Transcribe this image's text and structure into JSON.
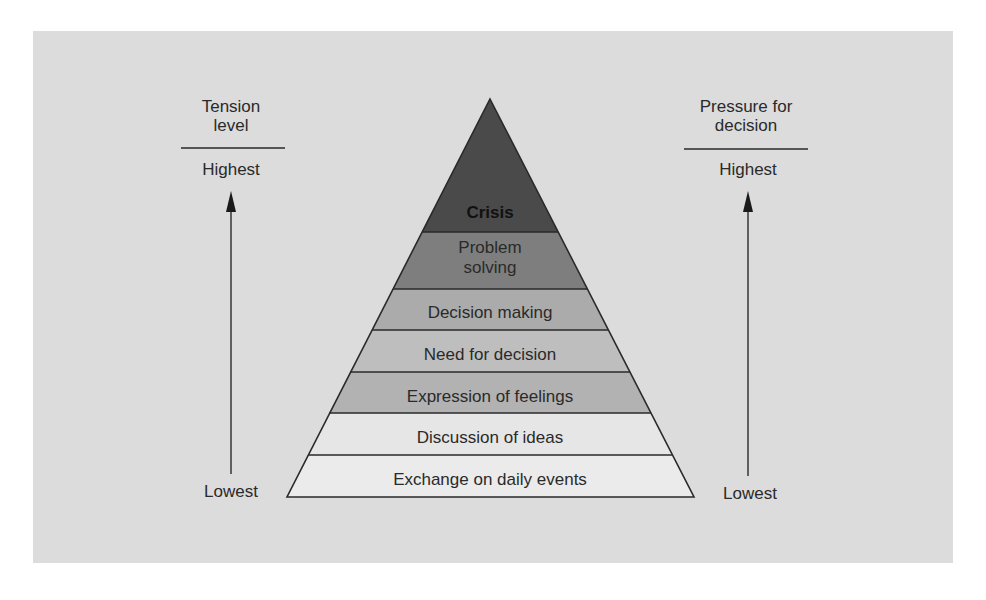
{
  "diagram": {
    "type": "pyramid",
    "levels": [
      {
        "label": "Crisis",
        "fill": "#4a4a4a",
        "bold": true
      },
      {
        "label": "Problem solving",
        "line1": "Problem",
        "line2": "solving",
        "fill": "#7e7e7e"
      },
      {
        "label": "Decision making",
        "fill": "#ababab"
      },
      {
        "label": "Need for decision",
        "fill": "#bebebe"
      },
      {
        "label": "Expression of feelings",
        "fill": "#b2b2b2"
      },
      {
        "label": "Discussion of ideas",
        "fill": "#e6e6e6"
      },
      {
        "label": "Exchange on daily events",
        "fill": "#ebebeb"
      }
    ],
    "order": "top-to-bottom"
  },
  "left_axis": {
    "title_line1": "Tension",
    "title_line2": "level",
    "top_label": "Highest",
    "bottom_label": "Lowest"
  },
  "right_axis": {
    "title_line1": "Pressure for",
    "title_line2": "decision",
    "top_label": "Highest",
    "bottom_label": "Lowest"
  },
  "colors": {
    "panel_background": "#dcdcdc",
    "outline": "#2a2a2a",
    "text": "#2a2a2a"
  }
}
